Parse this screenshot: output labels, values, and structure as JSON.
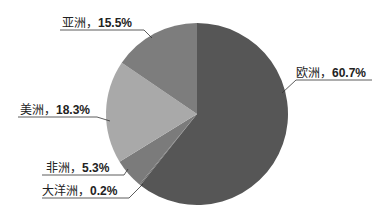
{
  "chart_data": {
    "type": "pie",
    "title": "",
    "categories": [
      "欧洲",
      "大洋洲",
      "非洲",
      "美洲",
      "亚洲"
    ],
    "values": [
      60.7,
      0.2,
      5.3,
      18.3,
      15.5
    ],
    "colors": [
      "#565656",
      "#6a6a6a",
      "#7b7b7b",
      "#a9a9a9",
      "#7d7d7d"
    ],
    "start_angle_deg": 0,
    "direction": "clockwise",
    "legend": "none",
    "data_labels": [
      {
        "name": "欧洲",
        "sep": "，",
        "value": "60.7%"
      },
      {
        "name": "大洋洲",
        "sep": "，",
        "value": "0.2%"
      },
      {
        "name": "非洲",
        "sep": "，",
        "value": "5.3%"
      },
      {
        "name": "美洲",
        "sep": "，",
        "value": "18.3%"
      },
      {
        "name": "亚洲",
        "sep": "，",
        "value": "15.5%"
      }
    ]
  }
}
